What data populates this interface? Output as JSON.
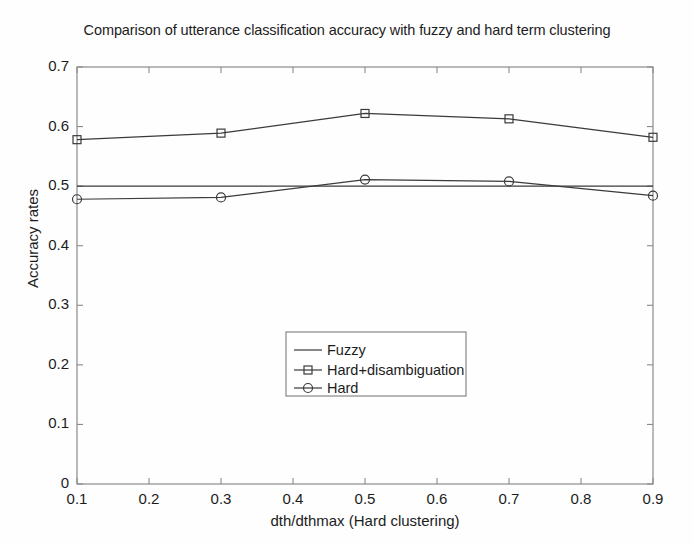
{
  "chart_data": {
    "type": "line",
    "title": "Comparison of utterance classification accuracy with fuzzy and hard term clustering",
    "xlabel": "dth/dthmax (Hard clustering)",
    "ylabel": "Accuracy rates",
    "x": [
      0.1,
      0.3,
      0.5,
      0.7,
      0.9
    ],
    "xlim": [
      0.1,
      0.9
    ],
    "ylim": [
      0,
      0.7
    ],
    "xticks": [
      "0.1",
      "0.2",
      "0.3",
      "0.4",
      "0.5",
      "0.6",
      "0.7",
      "0.8",
      "0.9"
    ],
    "xtick_values": [
      0.1,
      0.2,
      0.3,
      0.4,
      0.5,
      0.6,
      0.7,
      0.8,
      0.9
    ],
    "yticks": [
      "0",
      "0.1",
      "0.2",
      "0.3",
      "0.4",
      "0.5",
      "0.6",
      "0.7"
    ],
    "ytick_values": [
      0,
      0.1,
      0.2,
      0.3,
      0.4,
      0.5,
      0.6,
      0.7
    ],
    "grid": false,
    "legend_position": "center",
    "series": [
      {
        "name": "Fuzzy",
        "marker": "none",
        "color": "#3a3a3a",
        "x": [
          0.1,
          0.9
        ],
        "values": [
          0.5,
          0.5
        ]
      },
      {
        "name": "Hard+disambiguation",
        "marker": "square",
        "color": "#3a3a3a",
        "x": [
          0.1,
          0.3,
          0.5,
          0.7,
          0.9
        ],
        "values": [
          0.578,
          0.589,
          0.622,
          0.613,
          0.582
        ]
      },
      {
        "name": "Hard",
        "marker": "circle",
        "color": "#3a3a3a",
        "x": [
          0.1,
          0.3,
          0.5,
          0.7,
          0.9
        ],
        "values": [
          0.478,
          0.481,
          0.511,
          0.508,
          0.484
        ]
      }
    ]
  },
  "legend": {
    "items": [
      {
        "label": "Fuzzy"
      },
      {
        "label": "Hard+disambiguation"
      },
      {
        "label": "Hard"
      }
    ]
  },
  "axis": {
    "y_ticks": [
      {
        "label": "0.7"
      },
      {
        "label": "0.6"
      },
      {
        "label": "0.5"
      },
      {
        "label": "0.4"
      },
      {
        "label": "0.3"
      },
      {
        "label": "0.2"
      },
      {
        "label": "0.1"
      },
      {
        "label": "0"
      }
    ],
    "x_ticks": [
      {
        "label": "0.1"
      },
      {
        "label": "0.2"
      },
      {
        "label": "0.3"
      },
      {
        "label": "0.4"
      },
      {
        "label": "0.5"
      },
      {
        "label": "0.6"
      },
      {
        "label": "0.7"
      },
      {
        "label": "0.8"
      },
      {
        "label": "0.9"
      }
    ]
  }
}
